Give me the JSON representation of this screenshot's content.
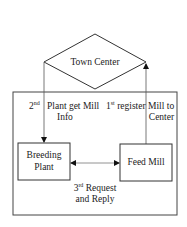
{
  "diagram": {
    "nodes": {
      "town_center": {
        "label": "Town Center",
        "shape": "diamond"
      },
      "breeding_plant": {
        "label_line1": "Breeding",
        "label_line2": "Plant",
        "shape": "rectangle"
      },
      "feed_mill": {
        "label": "Feed Mill",
        "shape": "rectangle"
      }
    },
    "edges": {
      "step1": {
        "ordinal_num": "1",
        "ordinal_sup": "st",
        "text_left": "register",
        "text_right_line1": "Mill to",
        "text_right_line2": "Center",
        "from": "Feed Mill",
        "to": "Town Center"
      },
      "step2": {
        "ordinal_num": "2",
        "ordinal_sup": "nd",
        "text_right_line1": "Plant get Mill",
        "text_right_line2": "Info",
        "from": "Town Center",
        "to": "Breeding Plant"
      },
      "step3": {
        "ordinal_num": "3",
        "ordinal_sup": "rd",
        "text_line1": "Request",
        "text_line2": "and Reply",
        "from": "Breeding Plant",
        "to": "Feed Mill",
        "bidirectional": true
      }
    },
    "colors": {
      "stroke": "#333333",
      "background": "#ffffff"
    }
  }
}
